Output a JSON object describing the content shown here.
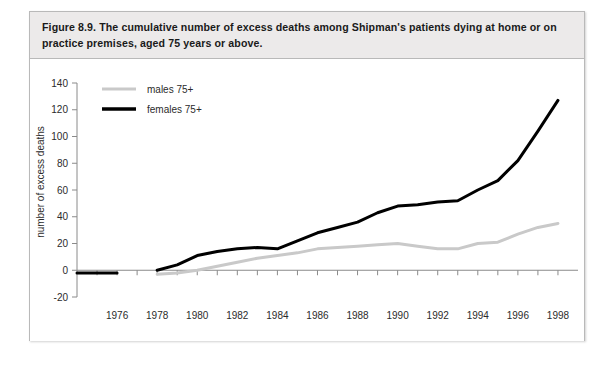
{
  "figure": {
    "caption": "Figure 8.9. The cumulative number of excess deaths among Shipman's patients dying at home or on practice premises, aged 75 years or above."
  },
  "chart_data": {
    "type": "line",
    "title": "",
    "xlabel": "year",
    "ylabel": "number of excess deaths",
    "xlim": [
      1974,
      1999
    ],
    "ylim": [
      -20,
      140
    ],
    "ytick_labels": [
      "140",
      "120",
      "100",
      "80",
      "60",
      "40",
      "20",
      "0",
      "-20"
    ],
    "yticks": [
      140,
      120,
      100,
      80,
      60,
      40,
      20,
      0,
      -20
    ],
    "xtick_labels": [
      "1976",
      "1978",
      "1980",
      "1982",
      "1984",
      "1986",
      "1988",
      "1990",
      "1992",
      "1994",
      "1996",
      "1998"
    ],
    "xticks": [
      1976,
      1978,
      1980,
      1982,
      1984,
      1986,
      1988,
      1990,
      1992,
      1994,
      1996,
      1998
    ],
    "xticks_minor_every": 1,
    "grid": false,
    "legend_position": "top-left-inside",
    "colors": {
      "males": "#c9c9c9",
      "females": "#000000",
      "axis": "#8a8a8a",
      "caption_band": "#eceaea",
      "frame": "#b9b9b9"
    },
    "x": [
      1974,
      1975,
      1976,
      1977,
      1978,
      1979,
      1980,
      1981,
      1982,
      1983,
      1984,
      1985,
      1986,
      1987,
      1988,
      1989,
      1990,
      1991,
      1992,
      1993,
      1994,
      1995,
      1996,
      1997,
      1998
    ],
    "series": [
      {
        "name": "males 75+",
        "key": "males",
        "color": "#c9c9c9",
        "width": 3,
        "values": [
          null,
          null,
          null,
          null,
          -3,
          -2,
          0,
          3,
          6,
          9,
          11,
          13,
          16,
          17,
          18,
          19,
          20,
          18,
          16,
          16,
          20,
          21,
          27,
          32,
          35
        ]
      },
      {
        "name": "females 75+",
        "key": "females",
        "color": "#000000",
        "width": 3,
        "values": [
          -2,
          -2,
          -2,
          null,
          0,
          4,
          11,
          14,
          16,
          17,
          16,
          22,
          28,
          32,
          36,
          43,
          48,
          49,
          51,
          52,
          60,
          67,
          82,
          104,
          127
        ]
      }
    ]
  },
  "legend": {
    "items": [
      {
        "label": "males 75+",
        "color": "#c9c9c9"
      },
      {
        "label": "females 75+",
        "color": "#000000"
      }
    ]
  }
}
